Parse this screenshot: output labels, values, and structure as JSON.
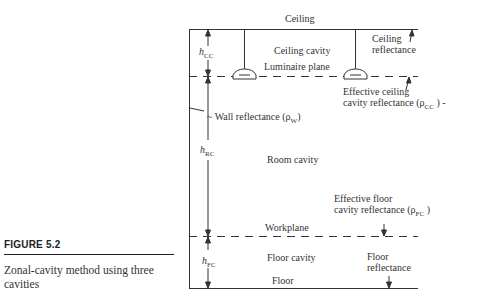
{
  "figure": {
    "number": "FIGURE 5.2",
    "caption": "Zonal-cavity method using three cavities"
  },
  "diagram": {
    "ceiling_label": "Ceiling",
    "ceiling_cavity_label": "Ceiling cavity",
    "luminaire_plane_label": "Luminaire plane",
    "ceiling_reflectance_line1": "Ceiling",
    "ceiling_reflectance_line2": "reflectance",
    "effective_ceiling_line1": "Effective ceiling",
    "effective_ceiling_line2": "cavity reflectance (ρ",
    "effective_ceiling_sub": "CC",
    "effective_ceiling_end": " ) -",
    "wall_reflectance": "~ Wall reflectance (ρ",
    "wall_reflectance_sub": "W",
    "wall_reflectance_end": ")",
    "room_cavity_label": "Room cavity",
    "effective_floor_line1": "Effective floor",
    "effective_floor_line2": "cavity reflectance (ρ",
    "effective_floor_sub": "FC",
    "effective_floor_end": " )",
    "workplane_label": "Workplane",
    "floor_cavity_label": "Floor cavity",
    "floor_reflectance_line1": "Floor",
    "floor_reflectance_line2": "reflectance",
    "floor_label": "Floor",
    "h_symbol": "h",
    "h_cc_sub": "CC",
    "h_rc_sub": "RC",
    "h_fc_sub": "FC"
  }
}
